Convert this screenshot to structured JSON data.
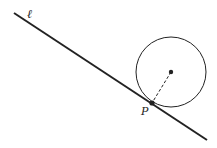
{
  "diagram": {
    "line_label": "ℓ",
    "point_label": "P",
    "colors": {
      "stroke": "#222222",
      "background": "#ffffff"
    },
    "line": {
      "x1": 14,
      "y1": 13,
      "x2": 207,
      "y2": 140
    },
    "circle": {
      "cx": 171,
      "cy": 72,
      "r": 35
    },
    "tangent_point": {
      "x": 152,
      "y": 103
    },
    "radius_style": "dashed"
  }
}
